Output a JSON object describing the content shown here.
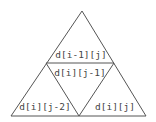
{
  "diagram": {
    "type": "triangle-dp-dependency",
    "cells": {
      "top": "d[i-1][j]",
      "center": "d[i][j-1]",
      "bottom_left": "d[i][j-2]",
      "bottom_right": "d[i][j]"
    },
    "colors": {
      "line": "#555555",
      "text": "#444444",
      "background": "#ffffff"
    }
  }
}
